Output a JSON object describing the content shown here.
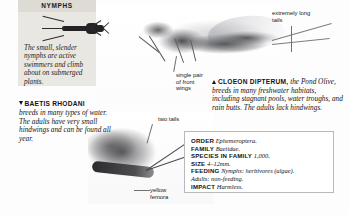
{
  "nymphs_panel": {
    "title": "NYMPHS",
    "body": "The small, slender nymphs are active swimmers and climb about on submerged plants."
  },
  "baetis_caption": {
    "marker": "triangle-down",
    "species": "BAETIS RHODANI",
    "text": "breeds in many types of water. The adults have very small hindwings and can be found all year."
  },
  "cloeon_caption": {
    "marker": "triangle-up",
    "species": "CLOEON DIPTERUM,",
    "text": "the Pond Olive, breeds in many freshwater habitats, including stagnant pools, water troughs, and rain butts. The adults lack hindwings."
  },
  "annotations": {
    "long_tails": "extremely long tails",
    "front_wings": "single pair of front wings",
    "two_tails": "two tails",
    "yellow_femora": "yellow femora"
  },
  "fact_box": {
    "rows": [
      {
        "key": "ORDER",
        "value": "Ephemeroptera."
      },
      {
        "key": "FAMILY",
        "value": "Baetidae."
      },
      {
        "key": "SPECIES IN FAMILY",
        "value": "1,000."
      },
      {
        "key": "SIZE",
        "value": "4–12mm."
      },
      {
        "key": "FEEDING",
        "value": "Nymphs: herbivores (algae)."
      },
      {
        "key": "IMPACT",
        "value": "Harmless."
      }
    ],
    "feeding_subline": "Adults: non-feeding."
  },
  "colors": {
    "panel_bg": "#e9e7e2",
    "panel_header_bg": "#dedbd4",
    "box_border": "#b9b9bc",
    "text": "#141414",
    "leader_line": "#6f7176"
  }
}
